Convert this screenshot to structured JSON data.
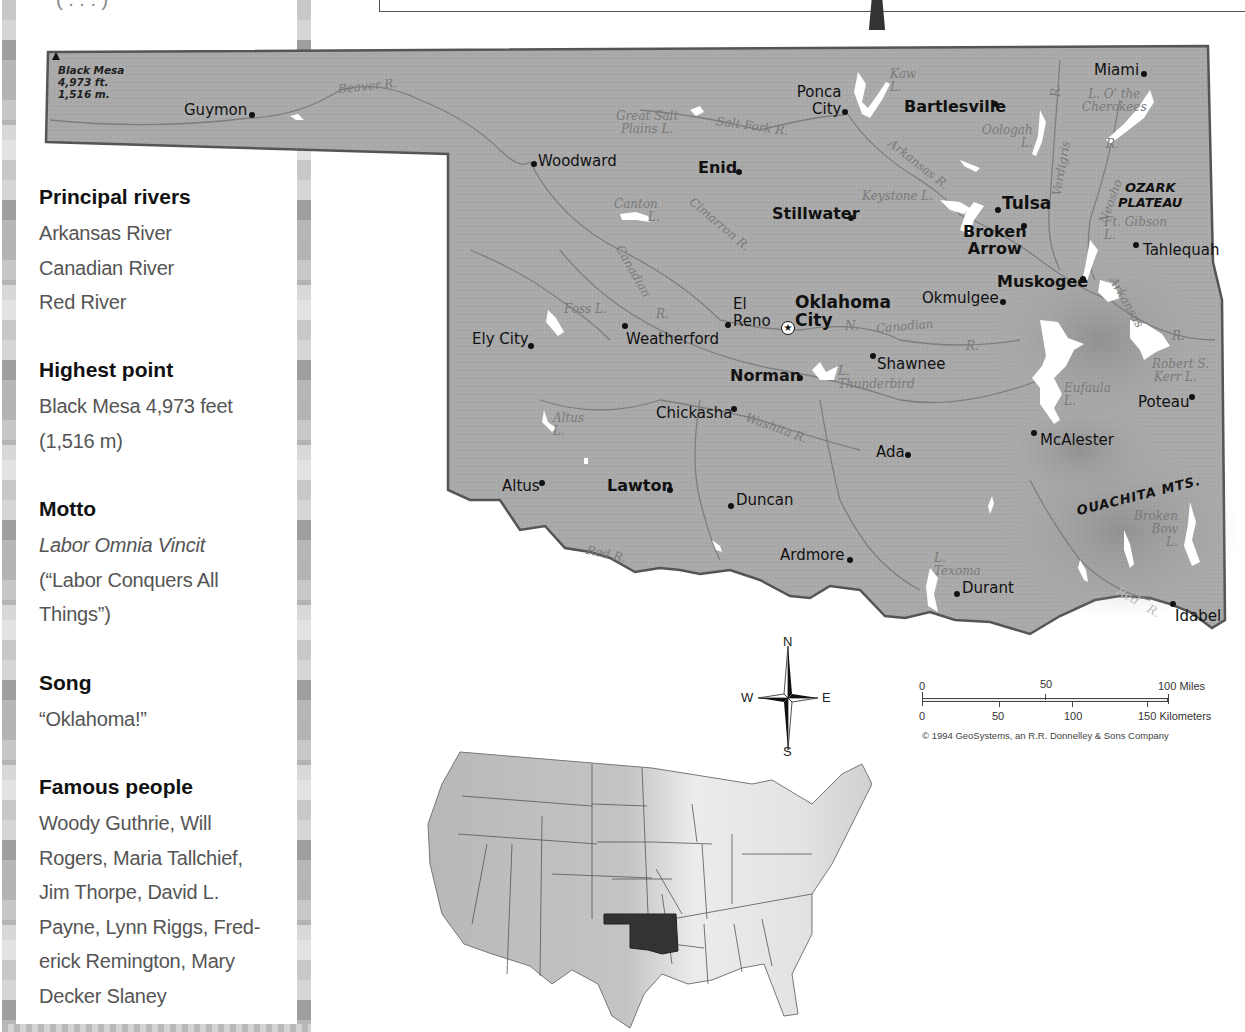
{
  "fact_panel": {
    "top_snippet": "( . . . )",
    "sections": [
      {
        "heading": "Principal rivers",
        "lines": [
          "Arkansas River",
          "Canadian River",
          "Red River"
        ]
      },
      {
        "heading": "Highest point",
        "lines": [
          "Black Mesa 4,973 feet",
          "(1,516 m)"
        ]
      },
      {
        "heading": "Motto",
        "lines": [
          "Labor Omnia Vincit",
          "(“Labor Conquers All",
          "Things”)"
        ],
        "italic_first_line": true
      },
      {
        "heading": "Song",
        "lines": [
          "“Oklahoma!”"
        ]
      },
      {
        "heading": "Famous people",
        "lines": [
          "Woody Guthrie, Will",
          "Rogers, Maria Tallchief,",
          "Jim Thorpe, David L.",
          "Payne, Lynn Riggs, Fred-",
          "erick Remington, Mary",
          "Decker Slaney"
        ]
      }
    ]
  },
  "map": {
    "fill_color": "#a9a9a9",
    "border_color": "#555555",
    "water_color": "#ffffff",
    "capital": {
      "name_line1": "Oklahoma",
      "name_line2": "City",
      "icon": "star-in-circle-icon"
    },
    "peak": {
      "name": "Black Mesa",
      "feet": "4,973 ft.",
      "meters": "1,516 m."
    },
    "cities": [
      {
        "name": "Guymon",
        "bold": false
      },
      {
        "name": "Woodward",
        "bold": false
      },
      {
        "name": "Enid",
        "bold": true
      },
      {
        "name": "Ponca",
        "name2": "City",
        "bold": false
      },
      {
        "name": "Bartlesville",
        "bold": true
      },
      {
        "name": "Miami",
        "bold": false
      },
      {
        "name": "Stillwater",
        "bold": true
      },
      {
        "name": "Tulsa",
        "bold": true
      },
      {
        "name": "Broken",
        "name2": "Arrow",
        "bold": true
      },
      {
        "name": "Tahlequah",
        "bold": false
      },
      {
        "name": "Muskogee",
        "bold": true
      },
      {
        "name": "Okmulgee",
        "bold": false
      },
      {
        "name": "El",
        "name2": "Reno",
        "bold": false
      },
      {
        "name": "Ely City",
        "bold": false
      },
      {
        "name": "Weatherford",
        "bold": false
      },
      {
        "name": "Shawnee",
        "bold": false
      },
      {
        "name": "Norman",
        "bold": true
      },
      {
        "name": "Chickasha",
        "bold": false
      },
      {
        "name": "Poteau",
        "bold": false
      },
      {
        "name": "McAlester",
        "bold": false
      },
      {
        "name": "Ada",
        "bold": false
      },
      {
        "name": "Altus",
        "bold": false
      },
      {
        "name": "Lawton",
        "bold": true
      },
      {
        "name": "Duncan",
        "bold": false
      },
      {
        "name": "Ardmore",
        "bold": false
      },
      {
        "name": "Durant",
        "bold": false
      },
      {
        "name": "Idabel",
        "bold": false
      }
    ],
    "water_labels": [
      {
        "text": "Beaver  R."
      },
      {
        "text": "Great Salt",
        "text2": "Plains L."
      },
      {
        "text": "Salt Fork   R."
      },
      {
        "text": "Kaw",
        "text2": "L."
      },
      {
        "text": "Oologah",
        "text2": "L."
      },
      {
        "text": "Verdigris"
      },
      {
        "text": "R."
      },
      {
        "text": "L. O' the",
        "text2": "Cherokees"
      },
      {
        "text": "Arkansas R."
      },
      {
        "text": "Keystone L."
      },
      {
        "text": "Canton",
        "text2": "L."
      },
      {
        "text": "Cimarron   R."
      },
      {
        "text": "Neosho"
      },
      {
        "text": "R."
      },
      {
        "text": "Ft. Gibson",
        "text2": "L."
      },
      {
        "text": "Canadian"
      },
      {
        "text": "R."
      },
      {
        "text": "Foss L."
      },
      {
        "text": "Canadian"
      },
      {
        "text": "R."
      },
      {
        "text": "N."
      },
      {
        "text": "L.",
        "text2": "Thunderbird"
      },
      {
        "text": "Arkansas"
      },
      {
        "text": "R."
      },
      {
        "text": "Robert S.",
        "text2": "Kerr L."
      },
      {
        "text": "Eufaula",
        "text2": "L."
      },
      {
        "text": "Altus",
        "text2": "L."
      },
      {
        "text": "Washita  R."
      },
      {
        "text": "Red    R."
      },
      {
        "text": "L.",
        "text2": "Texoma"
      },
      {
        "text": "Broken",
        "text2": "Bow",
        "text3": "L."
      },
      {
        "text": "Red",
        "text2": "R."
      }
    ],
    "regions": [
      {
        "text": "OZARK",
        "text2": "PLATEAU"
      },
      {
        "text": "OUACHITA MTS."
      }
    ]
  },
  "compass": {
    "n": "N",
    "s": "S",
    "e": "E",
    "w": "W"
  },
  "scale_bar": {
    "miles_labels": [
      "0",
      "50",
      "100 Miles"
    ],
    "km_labels": [
      "0",
      "50",
      "100",
      "150 Kilometers"
    ],
    "copyright": "© 1994 GeoSystems, an R.R. Donnelley & Sons Company"
  },
  "inset_map": {
    "highlighted_state": "Oklahoma",
    "highlight_color": "#333333"
  }
}
